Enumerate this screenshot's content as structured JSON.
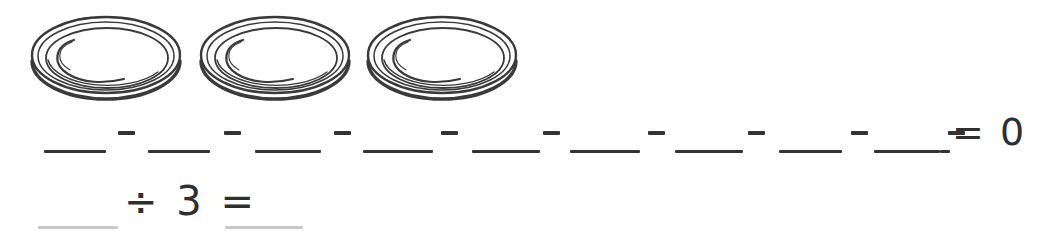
{
  "worksheet": {
    "background_color": "#ffffff",
    "ink_color": "#333333",
    "faint_ink_color": "#c8c8c8"
  },
  "plates_row": {
    "label": "three plates illustration",
    "count": 3,
    "plates": [
      {
        "name": "plate-1",
        "left": 28
      },
      {
        "name": "plate-2",
        "left": 197
      },
      {
        "name": "plate-3",
        "left": 364
      }
    ]
  },
  "equation_row": {
    "label": "repeated subtraction equation",
    "blank_count": 10,
    "operator": "−",
    "blanks": [
      {
        "left": 44,
        "width": 62,
        "value": ""
      },
      {
        "left": 148,
        "width": 62,
        "value": ""
      },
      {
        "left": 255,
        "width": 66,
        "value": ""
      },
      {
        "left": 363,
        "width": 70,
        "value": ""
      },
      {
        "left": 472,
        "width": 68,
        "value": ""
      },
      {
        "left": 570,
        "width": 70,
        "value": ""
      },
      {
        "left": 675,
        "width": 68,
        "value": ""
      },
      {
        "left": 779,
        "width": 63,
        "value": ""
      },
      {
        "left": 874,
        "width": 66,
        "value": ""
      },
      {
        "left": 940,
        "width": 10,
        "value": ""
      }
    ],
    "minus_signs": [
      {
        "left": 118
      },
      {
        "left": 224
      },
      {
        "left": 334
      },
      {
        "left": 441
      },
      {
        "left": 543
      },
      {
        "left": 648
      },
      {
        "left": 748
      },
      {
        "left": 851
      },
      {
        "left": 948
      }
    ],
    "result_text": "= 0",
    "result_value": "0"
  },
  "division_row": {
    "label": "division sentence",
    "expression_text": "÷ 3 =",
    "divisor": "3",
    "blanks": [
      {
        "name": "dividend-blank",
        "left": 38,
        "width": 80,
        "value": ""
      },
      {
        "name": "quotient-blank",
        "left": 225,
        "width": 78,
        "value": ""
      }
    ]
  }
}
